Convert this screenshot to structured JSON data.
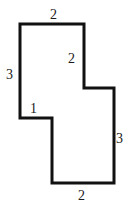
{
  "figure": {
    "kind": "polygon-diagram",
    "stroke_color": "#111111",
    "fill_color": "#ffffff",
    "background_color": "#ffffff",
    "stroke_width": 3,
    "canvas": {
      "width": 129,
      "height": 213
    },
    "vertices": [
      {
        "name": "top-left",
        "x": 20,
        "y": 24
      },
      {
        "name": "top-right",
        "x": 84,
        "y": 24
      },
      {
        "name": "upper-step-inner",
        "x": 84,
        "y": 88
      },
      {
        "name": "upper-step-outer",
        "x": 114,
        "y": 88
      },
      {
        "name": "bottom-right",
        "x": 114,
        "y": 183
      },
      {
        "name": "bottom-left",
        "x": 52,
        "y": 183
      },
      {
        "name": "lower-step-inner",
        "x": 52,
        "y": 118
      },
      {
        "name": "lower-step-outer",
        "x": 20,
        "y": 118
      }
    ],
    "labels": [
      {
        "id": "top",
        "text": "2",
        "x": 50,
        "y": 8,
        "edge": "top-edge"
      },
      {
        "id": "inner-right",
        "text": "2",
        "x": 68,
        "y": 52,
        "edge": "upper-right-vertical-edge"
      },
      {
        "id": "left",
        "text": "3",
        "x": 6,
        "y": 68,
        "edge": "upper-left-vertical-edge"
      },
      {
        "id": "notch",
        "text": "1",
        "x": 30,
        "y": 102,
        "edge": "left-notch-horizontal-edge"
      },
      {
        "id": "right",
        "text": "3",
        "x": 116,
        "y": 132,
        "edge": "lower-right-vertical-edge"
      },
      {
        "id": "bottom",
        "text": "2",
        "x": 78,
        "y": 189,
        "edge": "bottom-edge"
      }
    ]
  }
}
